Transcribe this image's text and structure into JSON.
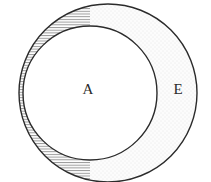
{
  "diagram": {
    "type": "venn-set-diagram",
    "background_color": "#ffffff",
    "stroke_color": "#2b2b2b",
    "labels": {
      "universe_label": "E",
      "subset_label": "A"
    },
    "regions": [
      {
        "name": "complement-of-A-in-E",
        "fill_pattern": "horizontal-line-hatch",
        "pattern_color": "#8a8a8a",
        "fill_color": "#ffffff",
        "description": "left crescent, hatched"
      },
      {
        "name": "set-A-interior",
        "fill_pattern": "none",
        "fill_color": "#ffffff",
        "description": "inner circle, plain white"
      },
      {
        "name": "set-E-outer-crescent",
        "fill_pattern": "fine-dot-stipple",
        "pattern_color": "#d8d8d8",
        "fill_color": "#fbfbfb",
        "description": "right crescent, lightly stippled"
      }
    ],
    "circles": [
      {
        "name": "circle-E",
        "cx": 108,
        "cy": 93,
        "r": 89,
        "stroke_width": 1.4
      },
      {
        "name": "circle-A",
        "cx": 90,
        "cy": 93,
        "r": 67,
        "stroke_width": 1.4
      }
    ],
    "label_positions": {
      "A": {
        "x": 88,
        "y": 91
      },
      "E": {
        "x": 178,
        "y": 91
      }
    }
  }
}
